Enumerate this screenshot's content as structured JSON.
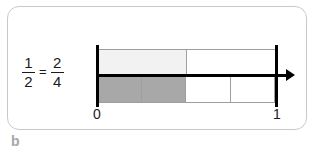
{
  "figure": {
    "caption_label": "b",
    "card_border_color": "#c9c9c9"
  },
  "equation": {
    "left_fraction": {
      "numerator": "1",
      "denominator": "2"
    },
    "operator": "=",
    "right_fraction": {
      "numerator": "2",
      "denominator": "4"
    },
    "text_color": "#1a1a1a"
  },
  "chart_data": {
    "type": "bar",
    "title": "",
    "subtitle": "",
    "xlabel": "",
    "ylabel": "",
    "axis_type": "number-line",
    "axis_min": 0,
    "axis_max": 1,
    "axis_has_arrow": true,
    "grid": false,
    "legend": "none",
    "tick_labels": [
      "0",
      "1"
    ],
    "tick_values": [
      0,
      1
    ],
    "series": [
      {
        "name": "halves",
        "partitions": 2,
        "shaded_count": 1,
        "fraction": "1/2",
        "value": 0.5,
        "cells": [
          {
            "index": 0,
            "start": 0,
            "end": 0.5,
            "shaded": true,
            "fill": "#f2f2f2"
          },
          {
            "index": 1,
            "start": 0.5,
            "end": 1,
            "shaded": false,
            "fill": "#ffffff"
          }
        ]
      },
      {
        "name": "fourths",
        "partitions": 4,
        "shaded_count": 2,
        "fraction": "2/4",
        "value": 0.5,
        "cells": [
          {
            "index": 0,
            "start": 0,
            "end": 0.25,
            "shaded": true,
            "fill": "#a8a8a8"
          },
          {
            "index": 1,
            "start": 0.25,
            "end": 0.5,
            "shaded": true,
            "fill": "#a8a8a8"
          },
          {
            "index": 2,
            "start": 0.5,
            "end": 0.75,
            "shaded": false,
            "fill": "#ffffff"
          },
          {
            "index": 3,
            "start": 0.75,
            "end": 1,
            "shaded": false,
            "fill": "#ffffff"
          }
        ]
      }
    ],
    "colors": {
      "shaded_light": "#f2f2f2",
      "shaded_dark": "#a8a8a8",
      "unshaded": "#ffffff",
      "cell_border": "#9e9e9e",
      "axis": "#000000"
    }
  }
}
